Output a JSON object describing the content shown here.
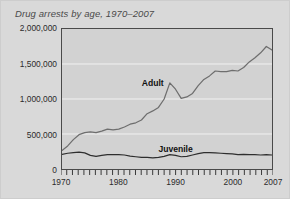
{
  "chart_data": {
    "type": "line",
    "title": "Drug arrests by age, 1970–2007",
    "xlabel": "",
    "ylabel": "",
    "xlim": [
      1970,
      2007
    ],
    "ylim": [
      0,
      2000000
    ],
    "grid": true,
    "legend_position": "inline-labels",
    "ytick_labels": [
      "2,000,000",
      "1,500,000",
      "1,000,000",
      "500,000",
      "0"
    ],
    "ytick_values": [
      2000000,
      1500000,
      1000000,
      500000,
      0
    ],
    "xtick_labels": [
      "1970",
      "1980",
      "1990",
      "2000",
      "2007"
    ],
    "xtick_values": [
      1970,
      1980,
      1990,
      2000,
      2007
    ],
    "minor_xticks_every": 1,
    "x": [
      1970,
      1971,
      1972,
      1973,
      1974,
      1975,
      1976,
      1977,
      1978,
      1979,
      1980,
      1981,
      1982,
      1983,
      1984,
      1985,
      1986,
      1987,
      1988,
      1989,
      1990,
      1991,
      1992,
      1993,
      1994,
      1995,
      1996,
      1997,
      1998,
      1999,
      2000,
      2001,
      2002,
      2003,
      2004,
      2005,
      2006,
      2007
    ],
    "series": [
      {
        "name": "Adult",
        "color": "#6e6e6e",
        "label_x": 1986,
        "label_y": 1230000,
        "values": [
          265000,
          330000,
          420000,
          490000,
          520000,
          530000,
          520000,
          540000,
          570000,
          560000,
          570000,
          600000,
          640000,
          660000,
          700000,
          790000,
          830000,
          880000,
          1000000,
          1230000,
          1140000,
          1010000,
          1030000,
          1080000,
          1190000,
          1280000,
          1330000,
          1400000,
          1390000,
          1390000,
          1410000,
          1400000,
          1450000,
          1530000,
          1590000,
          1660000,
          1750000,
          1700000
        ]
      },
      {
        "name": "Juvenile",
        "color": "#2e2e2e",
        "label_x": 1990,
        "label_y": 290000,
        "values": [
          210000,
          225000,
          235000,
          240000,
          230000,
          195000,
          180000,
          195000,
          205000,
          205000,
          205000,
          200000,
          185000,
          175000,
          165000,
          165000,
          160000,
          165000,
          180000,
          205000,
          195000,
          175000,
          180000,
          200000,
          220000,
          235000,
          235000,
          230000,
          225000,
          220000,
          215000,
          205000,
          210000,
          205000,
          205000,
          200000,
          205000,
          200000
        ]
      }
    ]
  }
}
